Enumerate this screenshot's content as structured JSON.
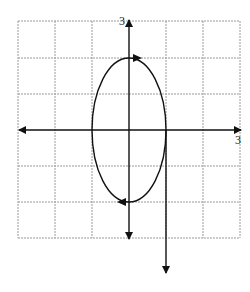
{
  "figure": {
    "type": "parametric-ellipse-graph",
    "grid": {
      "cols": 6,
      "rows": 6,
      "x_range": [
        -3,
        3
      ],
      "y_range": [
        -3,
        3
      ]
    },
    "labels": {
      "y_max": "3",
      "x_max": "3"
    },
    "ellipse": {
      "center": [
        0,
        0
      ],
      "semi_axis_x": 1,
      "semi_axis_y": 2,
      "orientation": "clockwise"
    },
    "extra_arrow": {
      "x": 1,
      "from_y": 0,
      "to_y": -4
    },
    "colors": {
      "grid": "#9a9a9a",
      "axis": "#111111",
      "curve": "#111111"
    }
  }
}
